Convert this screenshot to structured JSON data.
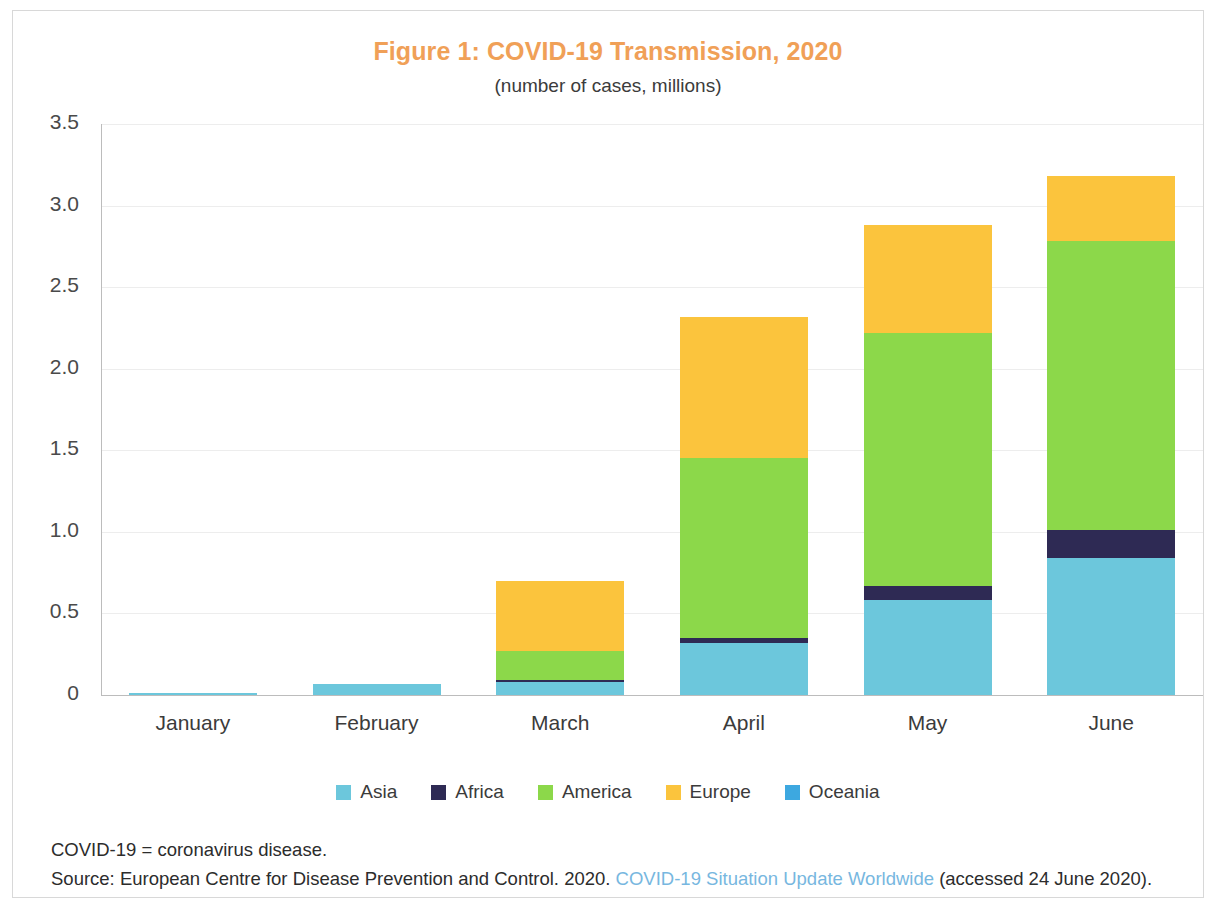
{
  "figure": {
    "title": "Figure 1: COVID-19 Transmission, 2020",
    "subtitle": "(number of cases, millions)",
    "title_color": "#F0A057"
  },
  "notes": {
    "abbreviation": "COVID-19 = coronavirus disease.",
    "source_prefix": "Source: European Centre for Disease Prevention and Control. 2020.",
    "source_link": "COVID-19 Situation Update Worldwide",
    "source_suffix": "(accessed 24 June 2020).",
    "link_color": "#77B7E0"
  },
  "chart_data": {
    "type": "bar",
    "stacked": true,
    "title": "Figure 1: COVID-19 Transmission, 2020",
    "subtitle": "(number of cases, millions)",
    "xlabel": "",
    "ylabel": "",
    "ylim": [
      0,
      3.5
    ],
    "yticks": [
      0,
      0.5,
      1.0,
      1.5,
      2.0,
      2.5,
      3.0,
      3.5
    ],
    "ytick_labels": [
      "0",
      "0.5",
      "1.0",
      "1.5",
      "2.0",
      "2.5",
      "3.0",
      "3.5"
    ],
    "grid": true,
    "legend_position": "bottom",
    "categories": [
      "January",
      "February",
      "March",
      "April",
      "May",
      "June"
    ],
    "series": [
      {
        "name": "Asia",
        "color": "#6CC7DC",
        "values": [
          0.01,
          0.07,
          0.08,
          0.32,
          0.58,
          0.84
        ]
      },
      {
        "name": "Africa",
        "color": "#2E2A54",
        "values": [
          0.0,
          0.0,
          0.01,
          0.03,
          0.09,
          0.17
        ]
      },
      {
        "name": "America",
        "color": "#8CD84A",
        "values": [
          0.0,
          0.0,
          0.18,
          1.1,
          1.55,
          1.77
        ]
      },
      {
        "name": "Europe",
        "color": "#FBC43D",
        "values": [
          0.0,
          0.0,
          0.43,
          0.87,
          0.66,
          0.4
        ]
      },
      {
        "name": "Oceania",
        "color": "#3DA8E0",
        "values": [
          0.0,
          0.0,
          0.0,
          0.0,
          0.0,
          0.0
        ]
      }
    ],
    "totals": [
      0.01,
      0.07,
      0.7,
      2.32,
      2.88,
      3.18
    ]
  }
}
